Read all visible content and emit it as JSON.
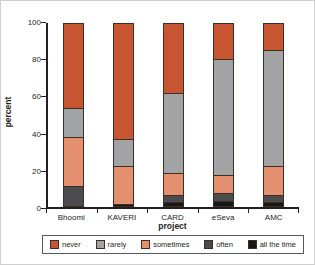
{
  "chart_data": {
    "type": "bar",
    "stacked": true,
    "title": "",
    "xlabel": "project",
    "ylabel": "percent",
    "ylim": [
      0,
      100
    ],
    "yticks": [
      0,
      20,
      40,
      60,
      80,
      100
    ],
    "grid": false,
    "legend_position": "bottom",
    "categories": [
      "Bhoomi",
      "KAVERI",
      "CARD",
      "eSeva",
      "AMC"
    ],
    "series": [
      {
        "name": "all the time",
        "color": "#171717",
        "values": [
          0,
          1,
          2,
          3,
          2
        ]
      },
      {
        "name": "often",
        "color": "#4c4c4e",
        "values": [
          11,
          0,
          4,
          4,
          4
        ]
      },
      {
        "name": "sometimes",
        "color": "#e38f70",
        "values": [
          27,
          21,
          12,
          10,
          16
        ]
      },
      {
        "name": "rarely",
        "color": "#a2a3a5",
        "values": [
          16,
          15,
          44,
          64,
          64
        ]
      },
      {
        "name": "never",
        "color": "#c75532",
        "values": [
          46,
          63,
          38,
          19,
          14
        ]
      }
    ],
    "legend": [
      "never",
      "rarely",
      "sometimes",
      "often",
      "all the time"
    ],
    "axis_color": "#231f20"
  }
}
